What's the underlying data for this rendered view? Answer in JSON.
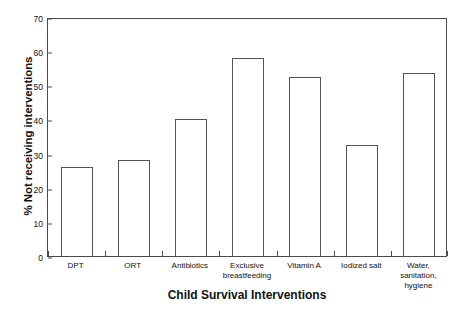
{
  "chart_data": {
    "type": "bar",
    "title": "",
    "subtitle": "",
    "xlabel": "Child Survival Interventions",
    "ylabel": "% Not receiving interventions",
    "categories": [
      "DPT",
      "ORT",
      "Antibiotics",
      "Exclusive\nbreastfeeding",
      "Vitamin  A",
      "Iodized salt",
      "Water,\nsanitation,\nhygiene"
    ],
    "values": [
      26,
      28,
      40,
      58,
      52.5,
      32.5,
      53.5
    ],
    "ylim": [
      0,
      70
    ],
    "yticks": [
      0,
      10,
      20,
      30,
      40,
      50,
      60,
      70
    ],
    "ytick_labels": [
      "0",
      "10",
      "20",
      "30",
      "40",
      "50",
      "60",
      "70"
    ],
    "grid": false,
    "legend": null,
    "bar_fill_color": "#ffffff",
    "bar_edge_color": "#555555",
    "axis_color": "#4a4a4a",
    "background_color": "#ffffff"
  }
}
